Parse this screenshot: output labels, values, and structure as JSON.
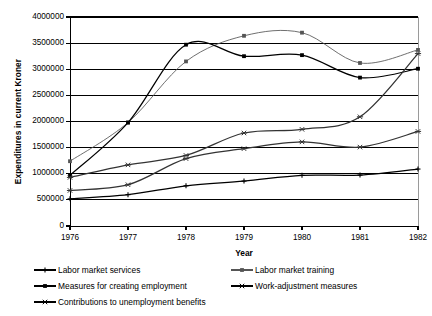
{
  "chart_data": {
    "type": "line",
    "title": "",
    "xlabel": "Year",
    "ylabel": "Expenditures in current Kroner",
    "grid": true,
    "legend_position": "bottom",
    "categories": [
      "1976",
      "1977",
      "1978",
      "1979",
      "1980",
      "1981",
      "1982"
    ],
    "x": [
      1976,
      1977,
      1978,
      1979,
      1980,
      1981,
      1982
    ],
    "xlim": [
      1976,
      1982
    ],
    "ylim": [
      0,
      4000000
    ],
    "ytick_labels": [
      "0",
      "500000",
      "1000000",
      "1500000",
      "2000000",
      "2500000",
      "3000000",
      "3500000",
      "4000000"
    ],
    "ytick_values": [
      0,
      500000,
      1000000,
      1500000,
      2000000,
      2500000,
      3000000,
      3500000,
      4000000
    ],
    "series": [
      {
        "name": "Labor market services",
        "marker": "plus",
        "color": "#000000",
        "values": [
          520000,
          600000,
          770000,
          860000,
          970000,
          975000,
          1090000
        ]
      },
      {
        "name": "Labor market training",
        "marker": "square",
        "color": "#555555",
        "values": [
          1240000,
          1980000,
          3150000,
          3640000,
          3700000,
          3120000,
          3370000
        ]
      },
      {
        "name": "Measures for creating employment",
        "marker": "square",
        "color": "#000000",
        "values": [
          970000,
          1980000,
          3470000,
          3250000,
          3270000,
          2840000,
          3010000
        ]
      },
      {
        "name": "Work-adjustment measures",
        "marker": "cross",
        "color": "#333333",
        "values": [
          930000,
          1170000,
          1350000,
          1780000,
          1850000,
          2090000,
          3300000
        ]
      },
      {
        "name": "Contributions to unemployment benefits",
        "marker": "cross",
        "color": "#333333",
        "values": [
          680000,
          790000,
          1290000,
          1480000,
          1610000,
          1510000,
          1810000
        ]
      }
    ]
  },
  "axes": {
    "y_title": "Expenditures in current Kroner",
    "x_title": "Year"
  },
  "legend": {
    "items": [
      {
        "label": "Labor market services",
        "marker": "plus"
      },
      {
        "label": "Labor market training",
        "marker": "square"
      },
      {
        "label": "Measures for creating employment",
        "marker": "square"
      },
      {
        "label": "Work-adjustment measures",
        "marker": "cross"
      },
      {
        "label": "Contributions to unemployment benefits",
        "marker": "cross"
      }
    ]
  }
}
